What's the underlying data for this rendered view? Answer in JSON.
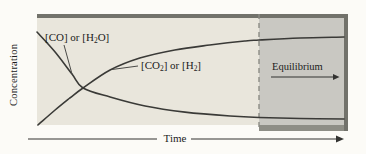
{
  "figure": {
    "description_role": "concentration-vs-time-equilibrium-figure"
  },
  "labels": {
    "equilibrium": "Equilibrium",
    "reactants_parts": [
      {
        "t": "[CO] or [H"
      },
      {
        "t": "2",
        "sub": true
      },
      {
        "t": "O]"
      }
    ],
    "products_parts": [
      {
        "t": "[CO"
      },
      {
        "t": "2",
        "sub": true
      },
      {
        "t": "] or [H"
      },
      {
        "t": "2",
        "sub": true
      },
      {
        "t": "]"
      }
    ]
  },
  "colors": {
    "plot_background": "#e9e6dc",
    "equilibrium_region": "#c9c8c2",
    "frame_border": "#72726b",
    "curve": "#3a3a37",
    "dashed_line": "#8b8b84"
  },
  "chart_data": {
    "type": "line",
    "title": "",
    "xlabel": "Time",
    "ylabel": "Concentration",
    "x_axis": {
      "ticks": [],
      "arrow_direction": "right"
    },
    "y_axis": {
      "ticks": []
    },
    "grid": false,
    "legend_position": "inline-labels",
    "equilibrium_region_start_x_fraction": 0.72,
    "annotations": [
      {
        "text": "Equilibrium",
        "arrow": "right",
        "region": "shaded-right"
      }
    ],
    "series": [
      {
        "name": "[CO] or [H2O]",
        "role": "reactants",
        "trend": "decreases then levels off at equilibrium",
        "points_frac": [
          [
            0.0,
            0.869
          ],
          [
            0.059,
            0.682
          ],
          [
            0.114,
            0.477
          ],
          [
            0.15,
            0.346
          ],
          [
            0.238,
            0.262
          ],
          [
            0.352,
            0.178
          ],
          [
            0.482,
            0.121
          ],
          [
            0.629,
            0.084
          ],
          [
            0.723,
            0.07
          ],
          [
            0.857,
            0.061
          ],
          [
            1.0,
            0.056
          ]
        ]
      },
      {
        "name": "[CO2] or [H2]",
        "role": "products",
        "trend": "increases then levels off at equilibrium",
        "points_frac": [
          [
            0.003,
            0.0
          ],
          [
            0.059,
            0.14
          ],
          [
            0.107,
            0.252
          ],
          [
            0.15,
            0.346
          ],
          [
            0.238,
            0.514
          ],
          [
            0.335,
            0.626
          ],
          [
            0.449,
            0.701
          ],
          [
            0.563,
            0.748
          ],
          [
            0.677,
            0.785
          ],
          [
            0.723,
            0.794
          ],
          [
            0.857,
            0.813
          ],
          [
            1.0,
            0.822
          ]
        ]
      }
    ]
  }
}
